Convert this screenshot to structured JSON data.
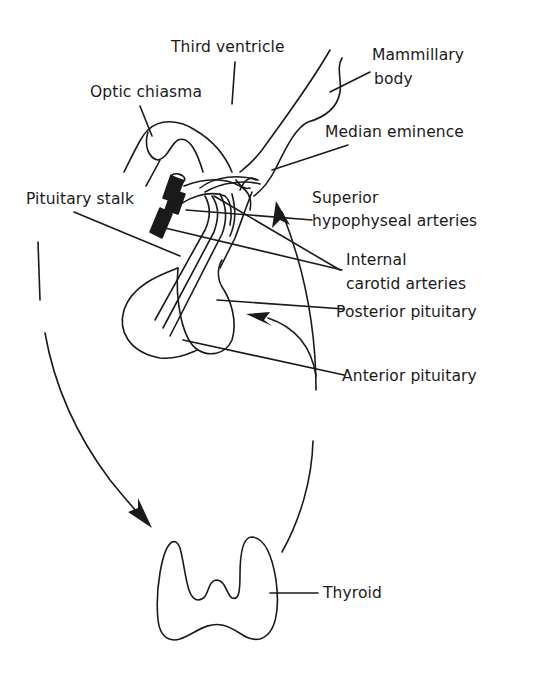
{
  "diagram": {
    "labels": {
      "third_ventricle": "Third ventricle",
      "mammillary_body_line1": "Mammillary",
      "mammillary_body_line2": "body",
      "optic_chiasma": "Optic chiasma",
      "median_eminence": "Median eminence",
      "superior_hypophyseal_line1": "Superior",
      "superior_hypophyseal_line2": "hypophyseal arteries",
      "pituitary_stalk": "Pituitary stalk",
      "internal_carotid_line1": "Internal",
      "internal_carotid_line2": "carotid arteries",
      "posterior_pituitary": "Posterior pituitary",
      "anterior_pituitary": "Anterior pituitary",
      "thyroid": "Thyroid"
    },
    "colors": {
      "ink": "#1a1a1a",
      "background": "#ffffff"
    }
  }
}
